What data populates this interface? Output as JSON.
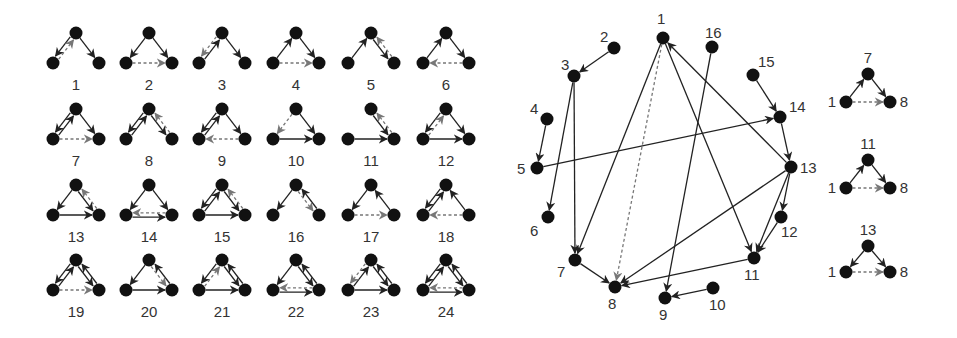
{
  "colors": {
    "node": "#111111",
    "edge": "#222222",
    "dashed_edge": "#777777",
    "label": "#333333"
  },
  "motif_grid": {
    "description": "24 triad motifs (3-node directed subgraphs); solid = existing edge, dashed grey = predicted/missing edge",
    "columns": 6,
    "col_x": [
      76,
      149,
      222,
      296,
      371,
      446
    ],
    "row_top_y": [
      33,
      109,
      185,
      260
    ],
    "half_width": 23,
    "height": 30,
    "label_offset": 22,
    "motifs": [
      {
        "id": "1",
        "solid": [
          [
            "T",
            "L"
          ],
          [
            "T",
            "R"
          ]
        ],
        "dashed": [
          [
            "L",
            "T"
          ]
        ]
      },
      {
        "id": "2",
        "solid": [
          [
            "T",
            "L"
          ],
          [
            "T",
            "R"
          ]
        ],
        "dashed": [
          [
            "L",
            "R"
          ]
        ]
      },
      {
        "id": "3",
        "solid": [
          [
            "L",
            "T"
          ],
          [
            "T",
            "R"
          ]
        ],
        "dashed": [
          [
            "T",
            "L"
          ]
        ]
      },
      {
        "id": "4",
        "solid": [
          [
            "L",
            "T"
          ],
          [
            "T",
            "R"
          ]
        ],
        "dashed": [
          [
            "L",
            "R"
          ]
        ]
      },
      {
        "id": "5",
        "solid": [
          [
            "L",
            "T"
          ],
          [
            "T",
            "R"
          ]
        ],
        "dashed": [
          [
            "R",
            "T"
          ]
        ]
      },
      {
        "id": "6",
        "solid": [
          [
            "L",
            "T"
          ],
          [
            "T",
            "R"
          ]
        ],
        "dashed": [
          [
            "R",
            "L"
          ]
        ]
      },
      {
        "id": "7",
        "solid": [
          [
            "T",
            "L"
          ],
          [
            "L",
            "T"
          ],
          [
            "T",
            "R"
          ]
        ],
        "dashed": [
          [
            "L",
            "R"
          ]
        ]
      },
      {
        "id": "8",
        "solid": [
          [
            "T",
            "L"
          ],
          [
            "L",
            "T"
          ],
          [
            "T",
            "R"
          ]
        ],
        "dashed": [
          [
            "R",
            "T"
          ]
        ]
      },
      {
        "id": "9",
        "solid": [
          [
            "T",
            "L"
          ],
          [
            "L",
            "T"
          ],
          [
            "T",
            "R"
          ]
        ],
        "dashed": [
          [
            "R",
            "L"
          ]
        ]
      },
      {
        "id": "10",
        "solid": [
          [
            "T",
            "R"
          ],
          [
            "L",
            "R"
          ]
        ],
        "dashed": [
          [
            "T",
            "L"
          ]
        ]
      },
      {
        "id": "11",
        "solid": [
          [
            "T",
            "R"
          ],
          [
            "L",
            "R"
          ]
        ],
        "dashed": [
          [
            "R",
            "T"
          ]
        ]
      },
      {
        "id": "12",
        "solid": [
          [
            "T",
            "L"
          ],
          [
            "T",
            "R"
          ],
          [
            "L",
            "R"
          ]
        ],
        "dashed": [
          [
            "L",
            "T"
          ]
        ]
      },
      {
        "id": "13",
        "solid": [
          [
            "T",
            "L"
          ],
          [
            "T",
            "R"
          ],
          [
            "L",
            "R"
          ]
        ],
        "dashed": [
          [
            "R",
            "T"
          ]
        ]
      },
      {
        "id": "14",
        "solid": [
          [
            "T",
            "L"
          ],
          [
            "T",
            "R"
          ],
          [
            "L",
            "R"
          ]
        ],
        "dashed": [
          [
            "R",
            "L"
          ]
        ]
      },
      {
        "id": "15",
        "solid": [
          [
            "T",
            "L"
          ],
          [
            "L",
            "T"
          ],
          [
            "T",
            "R"
          ],
          [
            "L",
            "R"
          ]
        ],
        "dashed": [
          [
            "R",
            "T"
          ]
        ]
      },
      {
        "id": "16",
        "solid": [
          [
            "T",
            "L"
          ],
          [
            "R",
            "T"
          ]
        ],
        "dashed": [
          [
            "T",
            "R"
          ]
        ]
      },
      {
        "id": "17",
        "solid": [
          [
            "T",
            "L"
          ],
          [
            "R",
            "T"
          ]
        ],
        "dashed": [
          [
            "L",
            "R"
          ]
        ]
      },
      {
        "id": "18",
        "solid": [
          [
            "T",
            "L"
          ],
          [
            "L",
            "T"
          ],
          [
            "R",
            "T"
          ]
        ],
        "dashed": [
          [
            "R",
            "L"
          ]
        ]
      },
      {
        "id": "19",
        "solid": [
          [
            "T",
            "L"
          ],
          [
            "L",
            "T"
          ],
          [
            "T",
            "R"
          ],
          [
            "R",
            "T"
          ]
        ],
        "dashed": [
          [
            "L",
            "R"
          ]
        ]
      },
      {
        "id": "20",
        "solid": [
          [
            "T",
            "L"
          ],
          [
            "L",
            "R"
          ],
          [
            "R",
            "T"
          ]
        ],
        "dashed": [
          [
            "T",
            "R"
          ]
        ]
      },
      {
        "id": "21",
        "solid": [
          [
            "T",
            "L"
          ],
          [
            "T",
            "R"
          ],
          [
            "R",
            "T"
          ],
          [
            "L",
            "R"
          ]
        ],
        "dashed": [
          [
            "L",
            "T"
          ]
        ]
      },
      {
        "id": "22",
        "solid": [
          [
            "T",
            "L"
          ],
          [
            "T",
            "R"
          ],
          [
            "R",
            "T"
          ],
          [
            "L",
            "R"
          ]
        ],
        "dashed": [
          [
            "R",
            "L"
          ]
        ]
      },
      {
        "id": "23",
        "solid": [
          [
            "L",
            "T"
          ],
          [
            "T",
            "R"
          ],
          [
            "R",
            "T"
          ],
          [
            "L",
            "R"
          ]
        ],
        "dashed": [
          [
            "T",
            "L"
          ]
        ]
      },
      {
        "id": "24",
        "solid": [
          [
            "T",
            "L"
          ],
          [
            "L",
            "T"
          ],
          [
            "T",
            "R"
          ],
          [
            "R",
            "T"
          ],
          [
            "L",
            "R"
          ]
        ],
        "dashed": [
          [
            "R",
            "L"
          ]
        ]
      }
    ]
  },
  "network": {
    "nodes": [
      {
        "id": "1",
        "x": 663,
        "y": 38,
        "lx": 657,
        "ly": 24
      },
      {
        "id": "2",
        "x": 614,
        "y": 48,
        "lx": 600,
        "ly": 42
      },
      {
        "id": "3",
        "x": 574,
        "y": 76,
        "lx": 561,
        "ly": 70
      },
      {
        "id": "4",
        "x": 547,
        "y": 119,
        "lx": 530,
        "ly": 114
      },
      {
        "id": "5",
        "x": 537,
        "y": 168,
        "lx": 517,
        "ly": 174
      },
      {
        "id": "6",
        "x": 548,
        "y": 217,
        "lx": 530,
        "ly": 236
      },
      {
        "id": "7",
        "x": 575,
        "y": 260,
        "lx": 557,
        "ly": 277
      },
      {
        "id": "8",
        "x": 615,
        "y": 287,
        "lx": 608,
        "ly": 309
      },
      {
        "id": "9",
        "x": 665,
        "y": 298,
        "lx": 659,
        "ly": 320
      },
      {
        "id": "10",
        "x": 713,
        "y": 288,
        "lx": 709,
        "ly": 310
      },
      {
        "id": "11",
        "x": 754,
        "y": 258,
        "lx": 744,
        "ly": 280
      },
      {
        "id": "12",
        "x": 781,
        "y": 217,
        "lx": 781,
        "ly": 237
      },
      {
        "id": "13",
        "x": 791,
        "y": 167,
        "lx": 800,
        "ly": 173
      },
      {
        "id": "14",
        "x": 780,
        "y": 117,
        "lx": 789,
        "ly": 112
      },
      {
        "id": "15",
        "x": 753,
        "y": 75,
        "lx": 758,
        "ly": 67
      },
      {
        "id": "16",
        "x": 712,
        "y": 47,
        "lx": 705,
        "ly": 38
      }
    ],
    "edges": [
      {
        "from": "2",
        "to": "3"
      },
      {
        "from": "4",
        "to": "5"
      },
      {
        "from": "3",
        "to": "6"
      },
      {
        "from": "3",
        "to": "7"
      },
      {
        "from": "1",
        "to": "7"
      },
      {
        "from": "7",
        "to": "8"
      },
      {
        "from": "1",
        "to": "11"
      },
      {
        "from": "13",
        "to": "1"
      },
      {
        "from": "16",
        "to": "9"
      },
      {
        "from": "10",
        "to": "9"
      },
      {
        "from": "5",
        "to": "14"
      },
      {
        "from": "15",
        "to": "14"
      },
      {
        "from": "14",
        "to": "13"
      },
      {
        "from": "13",
        "to": "12"
      },
      {
        "from": "12",
        "to": "11"
      },
      {
        "from": "13",
        "to": "11"
      },
      {
        "from": "13",
        "to": "8"
      },
      {
        "from": "11",
        "to": "8"
      }
    ],
    "dashed_edges": [
      {
        "from": "1",
        "to": "8"
      }
    ]
  },
  "side_triads": [
    {
      "top_label": "7",
      "left_label": "1",
      "right_label": "8",
      "cx": 868,
      "top_y": 74,
      "base_y": 102,
      "solid": [
        [
          "L",
          "T"
        ],
        [
          "T",
          "R"
        ]
      ],
      "dashed": [
        [
          "L",
          "R"
        ]
      ]
    },
    {
      "top_label": "11",
      "left_label": "1",
      "right_label": "8",
      "cx": 868,
      "top_y": 160,
      "base_y": 188,
      "solid": [
        [
          "L",
          "T"
        ],
        [
          "T",
          "R"
        ]
      ],
      "dashed": [
        [
          "L",
          "R"
        ]
      ]
    },
    {
      "top_label": "13",
      "left_label": "1",
      "right_label": "8",
      "cx": 868,
      "top_y": 246,
      "base_y": 272,
      "solid": [
        [
          "T",
          "L"
        ],
        [
          "T",
          "R"
        ]
      ],
      "dashed": [
        [
          "L",
          "R"
        ]
      ]
    }
  ]
}
